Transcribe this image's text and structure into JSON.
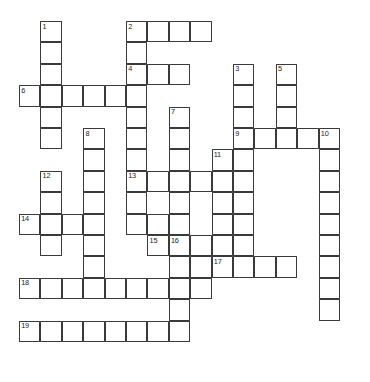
{
  "puzzle": {
    "kind": "crossword-grid",
    "title": "",
    "geometry": {
      "origin_x": 19,
      "origin_y": 21,
      "cell_size": 21.4,
      "cols": 16,
      "rows": 16,
      "canvas_width": 370,
      "canvas_height": 382
    },
    "colors": {
      "cell_fill": "#ffffff",
      "cell_border": "#3a3a3a",
      "number_text": "#1c1c1c",
      "page_background": "#ffffff"
    },
    "cells": [
      [
        1,
        0
      ],
      [
        1,
        1
      ],
      [
        1,
        2
      ],
      [
        1,
        3
      ],
      [
        1,
        4
      ],
      [
        1,
        5
      ],
      [
        5,
        0
      ],
      [
        6,
        0
      ],
      [
        7,
        0
      ],
      [
        8,
        0
      ],
      [
        5,
        1
      ],
      [
        5,
        2
      ],
      [
        6,
        2
      ],
      [
        7,
        2
      ],
      [
        10,
        2
      ],
      [
        12,
        2
      ],
      [
        0,
        3
      ],
      [
        1,
        3
      ],
      [
        2,
        3
      ],
      [
        3,
        3
      ],
      [
        4,
        3
      ],
      [
        5,
        3
      ],
      [
        10,
        3
      ],
      [
        12,
        3
      ],
      [
        5,
        4
      ],
      [
        7,
        4
      ],
      [
        10,
        4
      ],
      [
        12,
        4
      ],
      [
        1,
        4
      ],
      [
        1,
        5
      ],
      [
        3,
        5
      ],
      [
        5,
        5
      ],
      [
        7,
        5
      ],
      [
        10,
        5
      ],
      [
        11,
        5
      ],
      [
        12,
        5
      ],
      [
        13,
        5
      ],
      [
        14,
        5
      ],
      [
        3,
        6
      ],
      [
        5,
        6
      ],
      [
        7,
        6
      ],
      [
        9,
        6
      ],
      [
        10,
        6
      ],
      [
        14,
        6
      ],
      [
        1,
        7
      ],
      [
        3,
        7
      ],
      [
        5,
        7
      ],
      [
        6,
        7
      ],
      [
        7,
        7
      ],
      [
        8,
        7
      ],
      [
        9,
        7
      ],
      [
        10,
        7
      ],
      [
        14,
        7
      ],
      [
        1,
        8
      ],
      [
        3,
        8
      ],
      [
        5,
        8
      ],
      [
        7,
        8
      ],
      [
        9,
        8
      ],
      [
        10,
        8
      ],
      [
        14,
        8
      ],
      [
        0,
        9
      ],
      [
        1,
        9
      ],
      [
        2,
        9
      ],
      [
        3,
        9
      ],
      [
        5,
        9
      ],
      [
        6,
        9
      ],
      [
        7,
        9
      ],
      [
        9,
        9
      ],
      [
        10,
        9
      ],
      [
        14,
        9
      ],
      [
        1,
        10
      ],
      [
        3,
        10
      ],
      [
        6,
        10
      ],
      [
        7,
        10
      ],
      [
        8,
        10
      ],
      [
        9,
        10
      ],
      [
        10,
        10
      ],
      [
        14,
        10
      ],
      [
        3,
        11
      ],
      [
        7,
        11
      ],
      [
        8,
        11
      ],
      [
        9,
        11
      ],
      [
        10,
        11
      ],
      [
        11,
        11
      ],
      [
        12,
        11
      ],
      [
        14,
        11
      ],
      [
        0,
        12
      ],
      [
        1,
        12
      ],
      [
        2,
        12
      ],
      [
        3,
        12
      ],
      [
        4,
        12
      ],
      [
        5,
        12
      ],
      [
        6,
        12
      ],
      [
        7,
        12
      ],
      [
        8,
        12
      ],
      [
        14,
        12
      ],
      [
        7,
        13
      ],
      [
        14,
        13
      ],
      [
        0,
        14
      ],
      [
        1,
        14
      ],
      [
        2,
        14
      ],
      [
        3,
        14
      ],
      [
        4,
        14
      ],
      [
        5,
        14
      ],
      [
        6,
        14
      ],
      [
        7,
        14
      ]
    ],
    "numbers": [
      {
        "label": "1",
        "col": 1,
        "row": 0
      },
      {
        "label": "2",
        "col": 5,
        "row": 0
      },
      {
        "label": "3",
        "col": 10,
        "row": 2
      },
      {
        "label": "4",
        "col": 5,
        "row": 2
      },
      {
        "label": "5",
        "col": 12,
        "row": 2
      },
      {
        "label": "6",
        "col": 0,
        "row": 3
      },
      {
        "label": "7",
        "col": 7,
        "row": 4
      },
      {
        "label": "8",
        "col": 3,
        "row": 5
      },
      {
        "label": "9",
        "col": 10,
        "row": 5
      },
      {
        "label": "10",
        "col": 14,
        "row": 5
      },
      {
        "label": "11",
        "col": 9,
        "row": 6
      },
      {
        "label": "12",
        "col": 1,
        "row": 7
      },
      {
        "label": "13",
        "col": 5,
        "row": 7
      },
      {
        "label": "14",
        "col": 0,
        "row": 9
      },
      {
        "label": "15",
        "col": 6,
        "row": 10
      },
      {
        "label": "16",
        "col": 7,
        "row": 10
      },
      {
        "label": "17",
        "col": 9,
        "row": 11
      },
      {
        "label": "18",
        "col": 0,
        "row": 12
      },
      {
        "label": "19",
        "col": 0,
        "row": 14
      }
    ]
  }
}
